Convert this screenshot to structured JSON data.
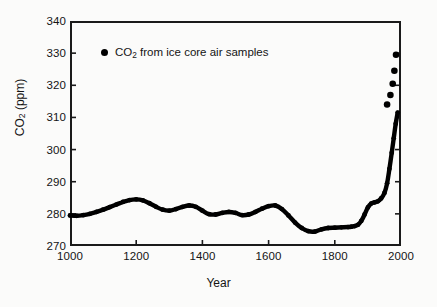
{
  "chart_data": {
    "type": "line",
    "title": "",
    "xlabel": "Year",
    "ylabel": "CO2 (ppm)",
    "ylabel_rich": {
      "base": "CO",
      "sub": "2",
      "tail": " (ppm)"
    },
    "xlim": [
      1000,
      2000
    ],
    "ylim": [
      270,
      340
    ],
    "xticks": [
      1000,
      1200,
      1400,
      1600,
      1800,
      2000
    ],
    "yticks": [
      270,
      280,
      290,
      300,
      310,
      320,
      330,
      340
    ],
    "grid": false,
    "legend_position": "upper-left-inside",
    "series": [
      {
        "name": "CO2 from ice core air samples",
        "marker": "filled-circle",
        "color": "#000000",
        "x": [
          1000,
          1020,
          1040,
          1060,
          1080,
          1100,
          1120,
          1140,
          1160,
          1180,
          1200,
          1220,
          1240,
          1260,
          1280,
          1300,
          1320,
          1340,
          1360,
          1380,
          1400,
          1420,
          1440,
          1460,
          1480,
          1500,
          1520,
          1540,
          1560,
          1580,
          1600,
          1620,
          1640,
          1660,
          1680,
          1700,
          1720,
          1740,
          1760,
          1780,
          1800,
          1820,
          1840,
          1850,
          1860,
          1870,
          1880,
          1890,
          1900,
          1910,
          1920,
          1930,
          1940,
          1950,
          1958,
          1965,
          1972,
          1978,
          1984,
          1990
        ],
        "y": [
          279.5,
          279.4,
          279.6,
          280.0,
          280.6,
          281.3,
          282.1,
          282.9,
          283.7,
          284.3,
          284.5,
          284.2,
          283.3,
          282.2,
          281.3,
          281.0,
          281.5,
          282.2,
          282.6,
          282.2,
          281.0,
          279.9,
          279.8,
          280.3,
          280.6,
          280.3,
          279.6,
          279.8,
          280.6,
          281.6,
          282.4,
          282.6,
          281.5,
          279.5,
          277.3,
          275.6,
          274.6,
          274.5,
          275.2,
          275.6,
          275.7,
          275.8,
          275.9,
          276.0,
          276.2,
          276.6,
          277.8,
          279.8,
          282.0,
          283.2,
          283.6,
          283.9,
          284.8,
          286.5,
          289.5,
          294.0,
          299.0,
          303.5,
          308.0,
          311.5
        ],
        "late_points": {
          "x": [
            1958,
            1968,
            1975,
            1980,
            1985
          ],
          "y": [
            314.0,
            317.0,
            320.5,
            324.5,
            329.5
          ],
          "note": "isolated circular markers at upper right"
        }
      }
    ]
  },
  "legend": {
    "entries": [
      {
        "marker": "filled-circle",
        "label_base": "CO",
        "label_sub": "2",
        "label_tail": " from ice core air samples"
      }
    ]
  },
  "axes": {
    "x": {
      "title": "Year",
      "ticks": [
        {
          "value": 1000,
          "label": "1000"
        },
        {
          "value": 1200,
          "label": "1200"
        },
        {
          "value": 1400,
          "label": "1400"
        },
        {
          "value": 1600,
          "label": "1600"
        },
        {
          "value": 1800,
          "label": "1800"
        },
        {
          "value": 2000,
          "label": "2000"
        }
      ]
    },
    "y": {
      "title_base": "CO",
      "title_sub": "2",
      "title_tail": " (ppm)",
      "ticks": [
        {
          "value": 340,
          "label": "340"
        },
        {
          "value": 330,
          "label": "330"
        },
        {
          "value": 320,
          "label": "320"
        },
        {
          "value": 310,
          "label": "310"
        },
        {
          "value": 300,
          "label": "300"
        },
        {
          "value": 290,
          "label": "290"
        },
        {
          "value": 280,
          "label": "280"
        },
        {
          "value": 270,
          "label": "270"
        }
      ]
    }
  },
  "colors": {
    "ink": "#141414",
    "data": "#000000",
    "paper": "#fbfbfa"
  }
}
